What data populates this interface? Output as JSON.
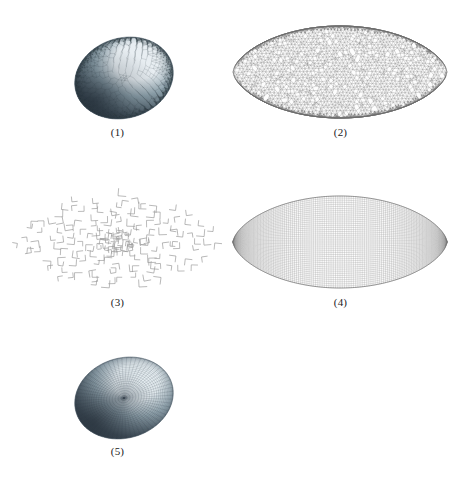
{
  "figure": {
    "background": "#ffffff",
    "width": 458,
    "height": 478,
    "layout": "2-column grid of 5 sub-figures; panels 1-2 on row 1, panels 3-4 on row 2, panel 5 alone on row 3 (left column)"
  },
  "panels": [
    {
      "id": "panel-1",
      "caption": "(1)",
      "kind": "shaded-3d-dome",
      "mesh_type": "triangular",
      "description": "Smooth-shaded three-dimensional dome (half-ellipsoid) covered by a dense unstructured triangular surface mesh, lit from the upper right.",
      "surface_colors": {
        "highlight": "#e8eef2",
        "mid": "#8fa3ad",
        "shadow": "#3c4a55",
        "deep_shadow": "#25303a",
        "edge": "#4a5a66"
      },
      "mesh_line_color": "#3a4852",
      "mesh_density": 46,
      "geometry": {
        "cx": 118,
        "cy": 72,
        "rx": 50,
        "ry": 50
      }
    },
    {
      "id": "panel-2",
      "caption": "(2)",
      "kind": "flat-lens-mesh",
      "mesh_type": "triangular",
      "description": "Flat planar lens (vesica-piscis) domain filled with an unstructured triangular mesh of roughly uniform element size.",
      "mesh_line_color": "#7b7b7b",
      "fill_color": "#ffffff",
      "mesh_density": 44,
      "geometry": {
        "cx": 111,
        "cy": 66,
        "half_width": 107,
        "half_height": 46
      }
    },
    {
      "id": "panel-3",
      "caption": "(3)",
      "kind": "flat-lens-corner-markers",
      "mesh_type": "partial-quad-corners",
      "description": "Flat lens domain populated with sparse L-shaped corner markers (two edges of each quadrilateral) arranged in concentric rings, indicating a partially advanced quadrilateral front.",
      "mesh_line_color": "#9a9a9a",
      "marker_count": 170,
      "geometry": {
        "cx": 111,
        "cy": 70,
        "half_width": 103,
        "half_height": 48
      }
    },
    {
      "id": "panel-4",
      "caption": "(4)",
      "kind": "flat-lens-mesh",
      "mesh_type": "quadrilateral",
      "description": "Flat lens domain filled with a fine structured/boundary-aligned all-quadrilateral mesh.",
      "mesh_line_color": "#8a8a8a",
      "fill_color": "#ffffff",
      "mesh_density": 58,
      "geometry": {
        "cx": 111,
        "cy": 66,
        "half_width": 107,
        "half_height": 46
      }
    },
    {
      "id": "panel-5",
      "caption": "(5)",
      "kind": "shaded-3d-dome",
      "mesh_type": "quadrilateral",
      "description": "Smooth-shaded three-dimensional dome identical in form to panel 1 but covered by an all-quadrilateral surface mesh.",
      "surface_colors": {
        "highlight": "#e4ecf0",
        "mid": "#93a6b0",
        "shadow": "#3f4d58",
        "deep_shadow": "#28323c",
        "edge": "#4d5d69"
      },
      "mesh_line_color": "#3d4b55",
      "mesh_density": 42,
      "geometry": {
        "cx": 118,
        "cy": 68,
        "rx": 50,
        "ry": 48
      }
    }
  ]
}
